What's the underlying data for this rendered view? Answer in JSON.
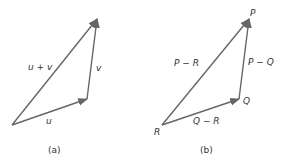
{
  "figures": [
    {
      "caption": "(a)",
      "vectors": [
        {
          "label": "u",
          "from": [
            12,
            125
          ],
          "to": [
            87,
            99
          ]
        },
        {
          "label": "v",
          "from": [
            87,
            99
          ],
          "to": [
            97,
            19
          ]
        },
        {
          "label": "u + v",
          "from": [
            12,
            125
          ],
          "to": [
            97,
            19
          ]
        }
      ]
    },
    {
      "caption": "(b)",
      "points": {
        "R": "R",
        "Q": "Q",
        "P": "P"
      },
      "vectors": [
        {
          "label": "Q − R",
          "from": [
            162,
            125
          ],
          "to": [
            239,
            99
          ]
        },
        {
          "label": "P − Q",
          "from": [
            239,
            99
          ],
          "to": [
            249,
            19
          ]
        },
        {
          "label": "P − R",
          "from": [
            162,
            125
          ],
          "to": [
            249,
            19
          ]
        }
      ]
    }
  ],
  "colors": {
    "arrow": "#666666",
    "text": "#333333"
  }
}
